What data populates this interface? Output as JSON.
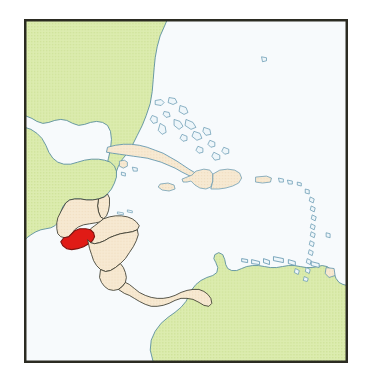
{
  "figure": {
    "kind": "locator-map",
    "title": "Location map of El Salvador in Central America and the Caribbean",
    "frame": {
      "visible": true,
      "border_color": "#2b2b22",
      "border_width_px": 1.5,
      "left_px": 24,
      "top_px": 19,
      "width_px": 324,
      "height_px": 344
    }
  },
  "palette": {
    "ocean": "#f7fafc",
    "land_outside_region": "#d9e9a8",
    "land_outside_region_texture": "#cfe199",
    "land_outside_region_outline": "#5b8f9e",
    "country_fill": "#f6e7cd",
    "country_outline": "#3a3a2e",
    "coastline_blue": "#5d93ad",
    "highlight_fill": "#e01b16",
    "highlight_outline": "#7d1410",
    "frame_border": "#2b2b22",
    "page_background": "#ffffff"
  },
  "legend": {
    "visible": false,
    "entries": [
      {
        "label": "Highlighted country",
        "swatch": "#e01b16"
      },
      {
        "label": "Regional countries",
        "swatch": "#f6e7cd"
      },
      {
        "label": "Other land",
        "swatch": "#d9e9a8"
      },
      {
        "label": "Water",
        "swatch": "#f7fafc"
      }
    ]
  },
  "highlight": {
    "name": "El Salvador",
    "fill": "#e01b16",
    "outline": "#7d1410"
  },
  "labels": {
    "visible": false,
    "note": "No text labels are rendered on this map."
  },
  "regions": {
    "green_land": [
      "United States (southeast)",
      "Mexico",
      "Yucatan Peninsula",
      "Colombia",
      "Venezuela",
      "Guyana"
    ],
    "beige_countries": [
      "Belize",
      "Guatemala",
      "Honduras",
      "Nicaragua",
      "Costa Rica",
      "Panama",
      "Cuba",
      "Jamaica",
      "Haiti",
      "Dominican Republic",
      "Puerto Rico",
      "Bahamas"
    ],
    "island_chains": [
      "Bahamas",
      "Greater Antilles",
      "Lesser Antilles",
      "Cayman Islands",
      "Netherlands Antilles"
    ]
  }
}
